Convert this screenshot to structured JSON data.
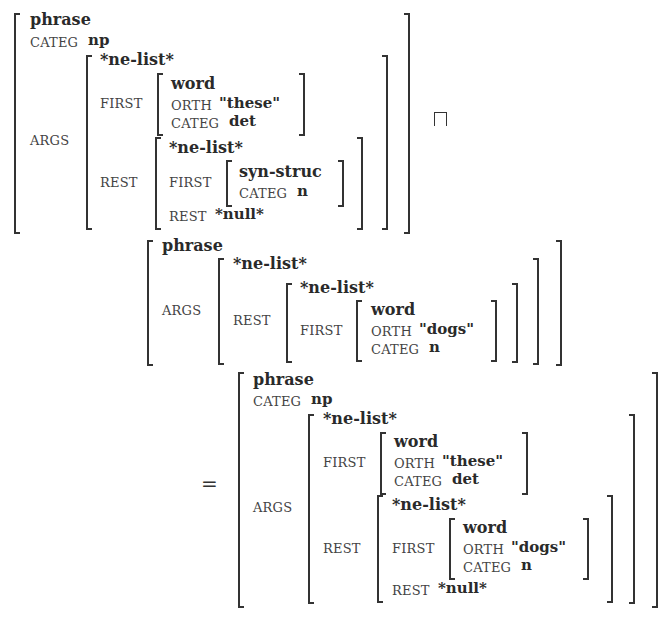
{
  "operators": {
    "unify": "⊓",
    "equals": "="
  },
  "fs1": {
    "type": "phrase",
    "categ_label": "CATEG",
    "categ_value": "np",
    "args_label": "ARGS",
    "args": {
      "type": "*ne-list*",
      "first_label": "FIRST",
      "first": {
        "type": "word",
        "orth_label": "ORTH",
        "orth_value": "\"these\"",
        "categ_label": "CATEG",
        "categ_value": "det"
      },
      "rest_label": "REST",
      "rest": {
        "type": "*ne-list*",
        "first_label": "FIRST",
        "first": {
          "type": "syn-struc",
          "categ_label": "CATEG",
          "categ_value": "n"
        },
        "rest_label": "REST",
        "rest_value": "*null*"
      }
    }
  },
  "fs2": {
    "type": "phrase",
    "args_label": "ARGS",
    "args": {
      "type": "*ne-list*",
      "rest_label": "REST",
      "rest": {
        "type": "*ne-list*",
        "first_label": "FIRST",
        "first": {
          "type": "word",
          "orth_label": "ORTH",
          "orth_value": "\"dogs\"",
          "categ_label": "CATEG",
          "categ_value": "n"
        }
      }
    }
  },
  "fs3": {
    "type": "phrase",
    "categ_label": "CATEG",
    "categ_value": "np",
    "args_label": "ARGS",
    "args": {
      "type": "*ne-list*",
      "first_label": "FIRST",
      "first": {
        "type": "word",
        "orth_label": "ORTH",
        "orth_value": "\"these\"",
        "categ_label": "CATEG",
        "categ_value": "det"
      },
      "rest_label": "REST",
      "rest": {
        "type": "*ne-list*",
        "first_label": "FIRST",
        "first": {
          "type": "word",
          "orth_label": "ORTH",
          "orth_value": "\"dogs\"",
          "categ_label": "CATEG",
          "categ_value": "n"
        },
        "rest_label": "REST",
        "rest_value": "*null*"
      }
    }
  }
}
